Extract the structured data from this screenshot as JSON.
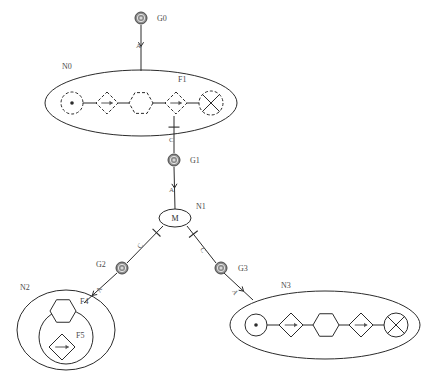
{
  "diagram": {
    "stroke_dark": "#2b2b2b",
    "stroke_mid": "#555555",
    "label_color": "#4a4a4a",
    "gnode_fill": "#8a8a8a",
    "gnode_ring": "#4a4a4a",
    "background": "#ffffff"
  },
  "groups": [
    {
      "id": "N0",
      "label": "N0",
      "label_x": 62,
      "label_y": 69,
      "cx": 141,
      "cy": 103,
      "rx": 96,
      "ry": 33,
      "style": "solid",
      "members": [
        {
          "type": "circle-dot",
          "cx": 72,
          "cy": 103,
          "r": 11,
          "dash": true,
          "label": ""
        },
        {
          "type": "diamond-arrow",
          "cx": 107,
          "cy": 103,
          "r": 11,
          "dash": true,
          "label": ""
        },
        {
          "type": "hexagon",
          "cx": 141,
          "cy": 103,
          "r": 12,
          "dash": true,
          "label": ""
        },
        {
          "type": "diamond-arrow",
          "cx": 176,
          "cy": 103,
          "r": 11,
          "dash": true,
          "label": "F1",
          "label_x": 178,
          "label_y": 82
        },
        {
          "type": "circle-cross",
          "cx": 211,
          "cy": 103,
          "r": 12,
          "dash": true,
          "label": ""
        }
      ]
    },
    {
      "id": "N2",
      "label": "N2",
      "label_x": 20,
      "label_y": 290,
      "cx": 66,
      "cy": 330,
      "rx": 49,
      "ry": 40,
      "style": "solid",
      "inner": {
        "cx": 66,
        "cy": 337,
        "r": 27
      },
      "members": [
        {
          "type": "hexagon",
          "cx": 63,
          "cy": 311,
          "r": 13,
          "dash": false,
          "label": "F4",
          "label_x": 80,
          "label_y": 304
        },
        {
          "type": "diamond-arrow",
          "cx": 62,
          "cy": 347,
          "r": 13,
          "dash": false,
          "label": "F5",
          "label_x": 76,
          "label_y": 338
        }
      ]
    },
    {
      "id": "N3",
      "label": "N3",
      "label_x": 281,
      "label_y": 288,
      "cx": 325,
      "cy": 325,
      "rx": 95,
      "ry": 34,
      "style": "solid",
      "members": [
        {
          "type": "circle-dot",
          "cx": 256,
          "cy": 325,
          "r": 11,
          "dash": false,
          "label": ""
        },
        {
          "type": "diamond-arrow",
          "cx": 291,
          "cy": 325,
          "r": 12,
          "dash": false,
          "label": ""
        },
        {
          "type": "hexagon",
          "cx": 326,
          "cy": 325,
          "r": 13,
          "dash": false,
          "label": ""
        },
        {
          "type": "diamond-arrow",
          "cx": 361,
          "cy": 325,
          "r": 12,
          "dash": false,
          "label": ""
        },
        {
          "type": "circle-cross",
          "cx": 396,
          "cy": 325,
          "r": 12,
          "dash": false,
          "label": ""
        }
      ]
    }
  ],
  "gnodes": [
    {
      "id": "G0",
      "label": "G0",
      "cx": 141,
      "cy": 18,
      "r": 6,
      "label_x": 157,
      "label_y": 21
    },
    {
      "id": "G1",
      "label": "G1",
      "cx": 174,
      "cy": 160,
      "r": 6,
      "label_x": 190,
      "label_y": 163
    },
    {
      "id": "G2",
      "label": "G2",
      "cx": 122,
      "cy": 268,
      "r": 6,
      "label_x": 96,
      "label_y": 267
    },
    {
      "id": "G3",
      "label": "G3",
      "cx": 221,
      "cy": 268,
      "r": 6,
      "label_x": 238,
      "label_y": 271
    }
  ],
  "mnode": {
    "id": "N1",
    "label": "N1",
    "inner_text": "M",
    "cx": 175,
    "cy": 218,
    "rx": 16,
    "ry": 9,
    "label_x": 196,
    "label_y": 209
  },
  "edges": [
    {
      "id": "e-g0-n0",
      "label": "A",
      "terminator": "arrow",
      "x1": 141,
      "y1": 25,
      "x2": 141,
      "y2": 71,
      "label_x": 136,
      "label_y": 48,
      "marker_t": 0.42
    },
    {
      "id": "e-n0-g1",
      "label": "C",
      "terminator": "bar",
      "x1": 174,
      "y1": 116,
      "x2": 174,
      "y2": 153,
      "label_x": 169,
      "label_y": 142,
      "marker_t": 0.3
    },
    {
      "id": "e-g1-n1",
      "label": "A",
      "terminator": "arrow",
      "x1": 174,
      "y1": 167,
      "x2": 175,
      "y2": 209,
      "label_x": 169,
      "label_y": 192,
      "marker_t": 0.45
    },
    {
      "id": "e-n1-g2",
      "label": "C",
      "terminator": "bar",
      "x1": 163,
      "y1": 226,
      "x2": 127,
      "y2": 263,
      "label_x": 141,
      "label_y": 249,
      "label_rot": -62,
      "marker_t": 0.18
    },
    {
      "id": "e-g2-n2",
      "label": "A",
      "terminator": "arrow",
      "x1": 117,
      "y1": 273,
      "x2": 84,
      "y2": 303,
      "label_x": 100,
      "label_y": 293,
      "label_rot": -62,
      "marker_t": 0.7
    },
    {
      "id": "e-n1-g3",
      "label": "C",
      "terminator": "bar",
      "x1": 187,
      "y1": 226,
      "x2": 216,
      "y2": 263,
      "label_x": 200,
      "label_y": 249,
      "label_rot": 62,
      "marker_t": 0.22
    },
    {
      "id": "e-g3-n3",
      "label": "A",
      "terminator": "arrow",
      "x1": 224,
      "y1": 273,
      "x2": 253,
      "y2": 300,
      "label_x": 232,
      "label_y": 291,
      "label_rot": 62,
      "marker_t": 0.62
    }
  ],
  "connectors": [
    {
      "id": "c-n0-1",
      "x1": 83,
      "y1": 103,
      "x2": 96,
      "y2": 103
    },
    {
      "id": "c-n0-2",
      "x1": 118,
      "y1": 103,
      "x2": 129,
      "y2": 103
    },
    {
      "id": "c-n0-3",
      "x1": 153,
      "y1": 103,
      "x2": 165,
      "y2": 103
    },
    {
      "id": "c-n0-4",
      "x1": 187,
      "y1": 103,
      "x2": 199,
      "y2": 103
    },
    {
      "id": "c-n3-1",
      "x1": 267,
      "y1": 325,
      "x2": 279,
      "y2": 325
    },
    {
      "id": "c-n3-2",
      "x1": 303,
      "y1": 325,
      "x2": 313,
      "y2": 325
    },
    {
      "id": "c-n3-3",
      "x1": 339,
      "y1": 325,
      "x2": 349,
      "y2": 325
    },
    {
      "id": "c-n3-4",
      "x1": 373,
      "y1": 325,
      "x2": 384,
      "y2": 325
    }
  ]
}
